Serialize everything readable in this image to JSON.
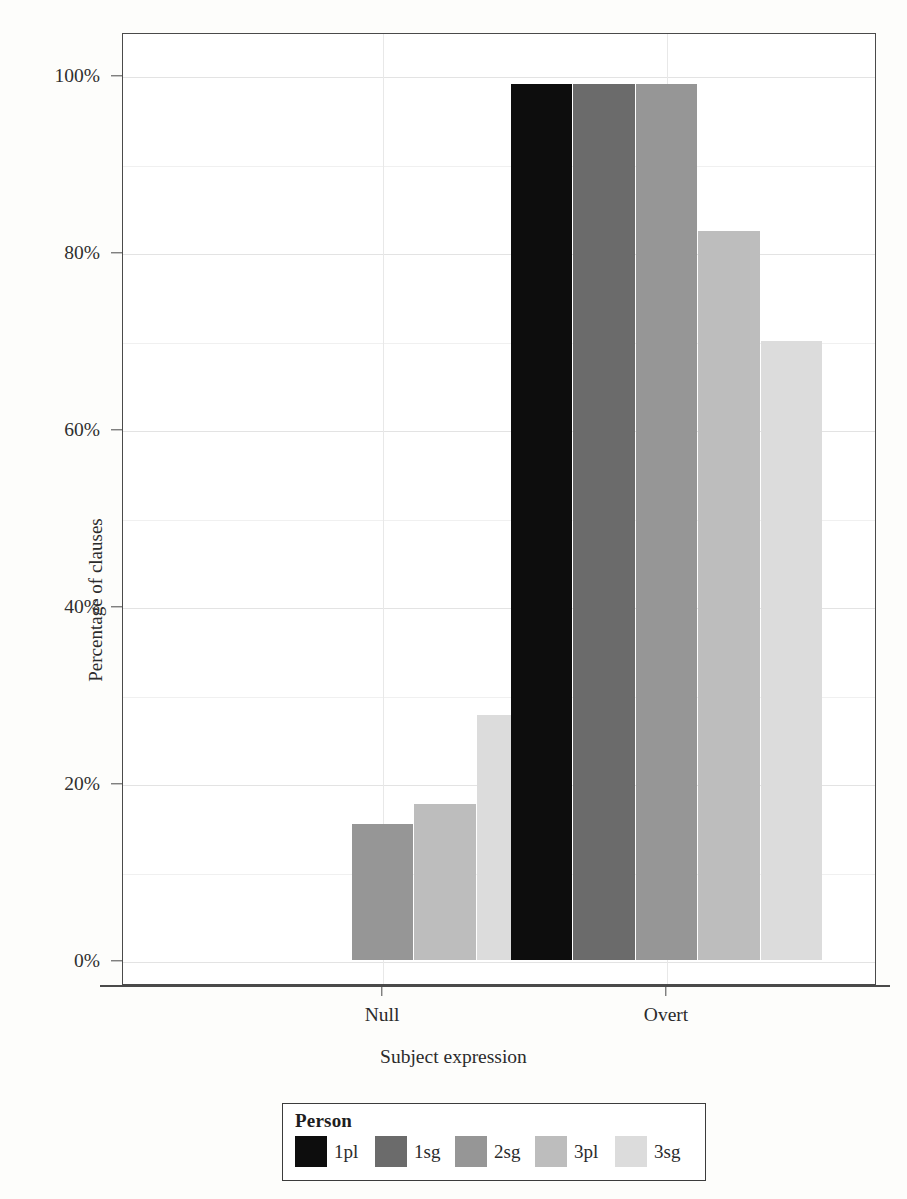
{
  "chart_data": {
    "type": "bar",
    "title": "",
    "xlabel": "Subject expression",
    "ylabel": "Percentage of clauses",
    "categories": [
      "Null",
      "Overt"
    ],
    "ylim": [
      0,
      100
    ],
    "ytick_labels": [
      "0%",
      "20%",
      "40%",
      "60%",
      "80%",
      "100%"
    ],
    "ytick_values": [
      0,
      20,
      40,
      60,
      80,
      100
    ],
    "grid": true,
    "legend_position": "below-center",
    "legend_title": "Person",
    "series": [
      {
        "name": "1pl",
        "color": "#0d0d0d",
        "values": [
          0,
          99.0
        ]
      },
      {
        "name": "1sg",
        "color": "#6b6b6b",
        "values": [
          0,
          99.0
        ]
      },
      {
        "name": "2sg",
        "color": "#969696",
        "values": [
          15.4,
          99.0
        ]
      },
      {
        "name": "3pl",
        "color": "#bdbdbd",
        "values": [
          17.6,
          82.4
        ]
      },
      {
        "name": "3sg",
        "color": "#dcdcdc",
        "values": [
          27.7,
          70.0
        ]
      }
    ]
  },
  "axes": {
    "ylabel": "Percentage of clauses",
    "xlabel": "Subject expression",
    "yticks": [
      {
        "label": "100%",
        "value": 100
      },
      {
        "label": "80%",
        "value": 80
      },
      {
        "label": "60%",
        "value": 60
      },
      {
        "label": "40%",
        "value": 40
      },
      {
        "label": "20%",
        "value": 20
      },
      {
        "label": "0%",
        "value": 0
      }
    ],
    "xticks": [
      {
        "label": "Null"
      },
      {
        "label": "Overt"
      }
    ]
  },
  "legend": {
    "title": "Person",
    "items": [
      {
        "label": "1pl",
        "color": "#0d0d0d"
      },
      {
        "label": "1sg",
        "color": "#6b6b6b"
      },
      {
        "label": "2sg",
        "color": "#969696"
      },
      {
        "label": "3pl",
        "color": "#bdbdbd"
      },
      {
        "label": "3sg",
        "color": "#dcdcdc"
      }
    ]
  }
}
